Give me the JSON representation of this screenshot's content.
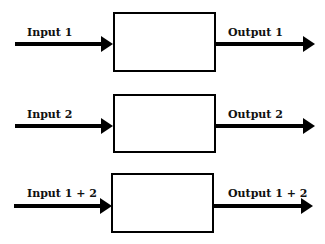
{
  "diagram": {
    "rows": [
      {
        "input_label": "Input 1",
        "output_label": "Output 1"
      },
      {
        "input_label": "Input 2",
        "output_label": "Output 2"
      },
      {
        "input_label": "Input 1 + 2",
        "output_label": "Output 1 + 2"
      }
    ],
    "colors": {
      "stroke": "#000000",
      "background": "#ffffff"
    }
  }
}
